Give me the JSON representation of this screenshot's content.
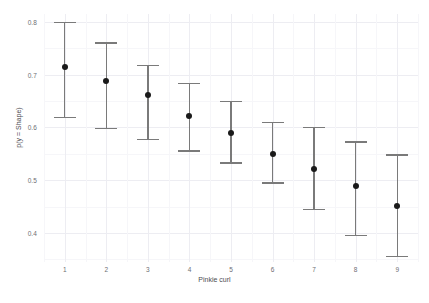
{
  "chart_data": {
    "type": "scatter",
    "title": "",
    "xlabel": "Pinkie curl",
    "ylabel": "p(y = Shape)",
    "x": [
      1,
      2,
      3,
      4,
      5,
      6,
      7,
      8,
      9
    ],
    "categories": [
      "1",
      "2",
      "3",
      "4",
      "5",
      "6",
      "7",
      "8",
      "9"
    ],
    "values": [
      0.715,
      0.688,
      0.662,
      0.622,
      0.589,
      0.549,
      0.521,
      0.489,
      0.452
    ],
    "error_low": [
      0.62,
      0.599,
      0.579,
      0.557,
      0.534,
      0.496,
      0.446,
      0.396,
      0.357
    ],
    "error_high": [
      0.8,
      0.761,
      0.719,
      0.685,
      0.65,
      0.611,
      0.601,
      0.574,
      0.549
    ],
    "series": [
      {
        "name": "p(y = Shape)",
        "values": [
          0.715,
          0.688,
          0.662,
          0.622,
          0.589,
          0.549,
          0.521,
          0.489,
          0.452
        ]
      }
    ],
    "xlim": [
      0.5,
      9.5
    ],
    "ylim": [
      0.345,
      0.815
    ],
    "ytick_labels": [
      "0.8",
      "0.7",
      "0.6",
      "0.5",
      "0.4"
    ],
    "ytick_values": [
      0.8,
      0.7,
      0.6,
      0.5,
      0.4
    ],
    "xtick_labels": [
      "1",
      "2",
      "3",
      "4",
      "5",
      "6",
      "7",
      "8",
      "9"
    ],
    "grid": true,
    "legend": "none",
    "marker_color": "#1a1a1a",
    "errorbar_color": "#7a7a7a",
    "grid_color": "#ededf2",
    "background_color": "#ffffff"
  }
}
